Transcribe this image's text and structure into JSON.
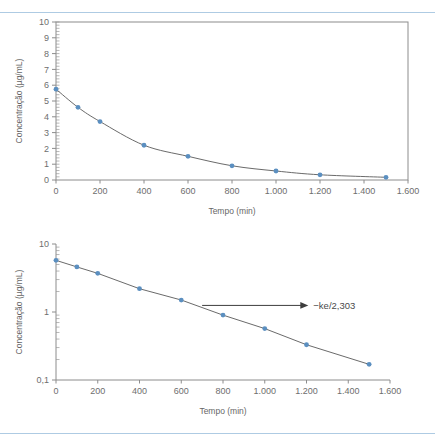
{
  "slide": {
    "divider_color": "#aecbe3",
    "marker_color": "#5b8fc0",
    "line_color": "#595959"
  },
  "chart_data": [
    {
      "type": "line",
      "id": "linear-plot",
      "title": "",
      "xlabel": "Tempo (min)",
      "ylabel": "Concentração (µg/mL)",
      "yscale": "linear",
      "xlim": [
        0,
        1600
      ],
      "ylim": [
        0,
        10
      ],
      "grid": false,
      "legend": "none",
      "frame": "box",
      "x_ticks": [
        0,
        200,
        400,
        600,
        800,
        1000,
        1200,
        1400,
        1600
      ],
      "x_tick_labels": [
        "0",
        "200",
        "400",
        "600",
        "800",
        "1.000",
        "1.200",
        "1.400",
        "1.600"
      ],
      "y_ticks": [
        0,
        1,
        2,
        3,
        4,
        5,
        6,
        7,
        8,
        9,
        10
      ],
      "y_tick_labels": [
        "0",
        "1",
        "2",
        "3",
        "4",
        "5",
        "6",
        "7",
        "8",
        "9",
        "10"
      ],
      "y_minor_ticks": true,
      "x": [
        0,
        100,
        200,
        400,
        600,
        800,
        1000,
        1200,
        1500
      ],
      "values": [
        5.75,
        4.6,
        3.7,
        2.2,
        1.5,
        0.9,
        0.57,
        0.33,
        0.17
      ],
      "annotations": []
    },
    {
      "type": "line",
      "id": "semilog-plot",
      "title": "",
      "xlabel": "Tempo (min)",
      "ylabel": "Concentração (µg/mL)",
      "yscale": "log",
      "xlim": [
        0,
        1600
      ],
      "ylim": [
        0.1,
        10
      ],
      "grid": false,
      "legend": "none",
      "frame": "left-bottom",
      "x_ticks": [
        0,
        200,
        400,
        600,
        800,
        1000,
        1200,
        1400,
        1600
      ],
      "x_tick_labels": [
        "0",
        "200",
        "400",
        "600",
        "800",
        "1.000",
        "1.200",
        "1.400",
        "1.600"
      ],
      "y_ticks": [
        10,
        1,
        0.1
      ],
      "y_tick_labels": [
        "10",
        "1",
        "0,1"
      ],
      "y_minor_ticks": true,
      "x": [
        0,
        100,
        200,
        400,
        600,
        800,
        1000,
        1200,
        1500
      ],
      "values": [
        5.75,
        4.6,
        3.7,
        2.2,
        1.5,
        0.9,
        0.57,
        0.33,
        0.17
      ],
      "annotations": [
        {
          "text": "−ke/2,303",
          "kind": "arrow-label"
        }
      ]
    }
  ],
  "linear_chart": {
    "ylabel": "Concentração (µg/mL)",
    "xlabel": "Tempo (min)",
    "y_labels": [
      "10",
      "9",
      "8",
      "7",
      "6",
      "5",
      "4",
      "3",
      "2",
      "1",
      "0"
    ],
    "x_labels": [
      "0",
      "200",
      "400",
      "600",
      "800",
      "1.000",
      "1.200",
      "1.400",
      "1.600"
    ]
  },
  "log_chart": {
    "ylabel": "Concentração (µg/mL)",
    "xlabel": "Tempo (min)",
    "y_labels": [
      "10",
      "1",
      "0,1"
    ],
    "x_labels": [
      "0",
      "200",
      "400",
      "600",
      "800",
      "1.000",
      "1.200",
      "1.400",
      "1.600"
    ],
    "slope_annotation": "−ke/2,303"
  }
}
